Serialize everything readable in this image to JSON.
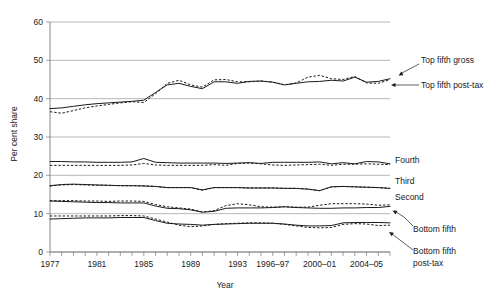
{
  "chart_data": {
    "type": "line",
    "title": "",
    "xlabel": "Year",
    "ylabel": "Per cent share",
    "ylim": [
      0,
      60
    ],
    "yticks": [
      0,
      10,
      20,
      30,
      40,
      50,
      60
    ],
    "grid": true,
    "legend_position": "right-inline-labels",
    "xlim": [
      1977,
      2006
    ],
    "x": [
      1977,
      1978,
      1979,
      1980,
      1981,
      1982,
      1983,
      1984,
      1985,
      1986,
      1987,
      1988,
      1989,
      1990,
      1991,
      1992,
      1993,
      1994,
      1995,
      1996,
      1997,
      1998,
      1999,
      2000,
      2001,
      2002,
      2003,
      2004,
      2005,
      2006
    ],
    "xtick_labels": [
      "1977",
      "1981",
      "1985",
      "1989",
      "1993",
      "1996–97",
      "2000–01",
      "2004–05"
    ],
    "xtick_values": [
      1977,
      1981,
      1985,
      1989,
      1993,
      1996,
      2000,
      2004
    ],
    "series": [
      {
        "name": "Top fifth gross",
        "style": "solid",
        "values": [
          37.4,
          37.6,
          38.0,
          38.4,
          38.7,
          38.9,
          39.1,
          39.3,
          39.6,
          41.6,
          43.6,
          44.0,
          43.2,
          42.6,
          44.4,
          44.4,
          44.0,
          44.5,
          44.6,
          44.3,
          43.6,
          44.0,
          44.4,
          44.5,
          44.8,
          44.6,
          45.6,
          44.3,
          44.5,
          45.2
        ]
      },
      {
        "name": "Top fifth post-tax",
        "style": "dashed",
        "values": [
          36.6,
          36.2,
          36.9,
          37.6,
          38.1,
          38.5,
          38.9,
          39.2,
          39.0,
          41.3,
          44.0,
          44.8,
          43.6,
          43.0,
          44.9,
          45.0,
          44.4,
          44.4,
          44.6,
          44.3,
          43.6,
          44.1,
          45.6,
          46.1,
          45.2,
          45.0,
          45.8,
          44.1,
          44.0,
          45.0
        ]
      },
      {
        "name": "Fourth",
        "style": "solid",
        "values": [
          23.6,
          23.6,
          23.5,
          23.5,
          23.4,
          23.4,
          23.4,
          23.5,
          24.4,
          23.4,
          23.3,
          23.2,
          23.2,
          23.2,
          23.2,
          23.1,
          23.2,
          23.3,
          23.1,
          23.4,
          23.4,
          23.4,
          23.4,
          23.5,
          23.0,
          23.3,
          23.0,
          23.6,
          23.5,
          23.0
        ]
      },
      {
        "name": "Fourth post-tax",
        "style": "dashed",
        "values": [
          22.6,
          22.6,
          22.6,
          22.6,
          22.6,
          22.6,
          22.6,
          22.7,
          23.1,
          22.7,
          22.6,
          22.6,
          22.6,
          22.6,
          22.8,
          22.6,
          23.1,
          23.2,
          23.0,
          22.7,
          22.6,
          22.7,
          22.8,
          22.9,
          22.6,
          22.9,
          22.9,
          23.0,
          22.9,
          22.8
        ]
      },
      {
        "name": "Third",
        "style": "solid",
        "values": [
          17.3,
          17.6,
          17.7,
          17.6,
          17.5,
          17.4,
          17.3,
          17.3,
          17.2,
          17.1,
          16.8,
          16.8,
          16.8,
          16.2,
          16.8,
          16.8,
          16.8,
          16.7,
          16.7,
          16.7,
          16.6,
          16.6,
          16.4,
          16.0,
          17.0,
          17.1,
          17.0,
          16.9,
          16.8,
          16.6
        ]
      },
      {
        "name": "Third post-tax",
        "style": "dashed",
        "values": [
          17.2,
          17.5,
          17.6,
          17.5,
          17.4,
          17.4,
          17.3,
          17.3,
          17.3,
          17.1,
          16.8,
          16.8,
          16.8,
          16.1,
          16.8,
          16.8,
          16.8,
          16.7,
          16.7,
          16.7,
          16.6,
          16.6,
          16.4,
          16.0,
          17.0,
          17.1,
          17.0,
          16.9,
          16.8,
          16.6
        ]
      },
      {
        "name": "Second",
        "style": "solid",
        "values": [
          13.3,
          13.2,
          13.1,
          13.0,
          12.9,
          12.9,
          12.8,
          12.8,
          12.8,
          12.0,
          11.4,
          11.3,
          11.0,
          10.4,
          10.6,
          11.4,
          11.5,
          11.5,
          11.5,
          11.6,
          11.8,
          11.6,
          11.5,
          11.4,
          11.4,
          11.5,
          11.5,
          11.6,
          11.6,
          11.9
        ]
      },
      {
        "name": "Second post-tax",
        "style": "dashed",
        "values": [
          13.4,
          13.4,
          13.4,
          13.3,
          13.3,
          13.2,
          13.3,
          13.3,
          13.2,
          12.4,
          11.8,
          11.5,
          11.2,
          10.4,
          10.8,
          12.1,
          12.6,
          12.3,
          11.8,
          11.7,
          11.8,
          11.7,
          11.7,
          12.2,
          12.6,
          12.6,
          12.6,
          12.5,
          12.2,
          12.3
        ]
      },
      {
        "name": "Bottom fifth",
        "style": "solid",
        "values": [
          8.6,
          8.7,
          8.8,
          8.9,
          8.9,
          8.9,
          9.0,
          9.0,
          9.0,
          8.2,
          7.5,
          7.3,
          7.2,
          7.0,
          7.2,
          7.3,
          7.4,
          7.5,
          7.5,
          7.5,
          7.3,
          7.0,
          6.8,
          6.8,
          6.9,
          7.6,
          7.7,
          7.7,
          7.7,
          7.6
        ]
      },
      {
        "name": "Bottom fifth post-tax",
        "style": "dashed",
        "values": [
          9.4,
          9.4,
          9.4,
          9.4,
          9.4,
          9.4,
          9.5,
          9.5,
          9.4,
          8.6,
          7.8,
          7.0,
          6.6,
          6.8,
          7.2,
          7.4,
          7.5,
          7.6,
          7.6,
          7.5,
          7.2,
          6.8,
          6.4,
          6.3,
          6.4,
          7.2,
          7.4,
          7.3,
          6.9,
          7.0
        ]
      }
    ],
    "annotations": [
      {
        "text": "Top fifth gross",
        "target_series": "Top fifth gross"
      },
      {
        "text": "Top fifth post-tax",
        "target_series": "Top fifth post-tax"
      },
      {
        "text": "Fourth",
        "target_series": "Fourth"
      },
      {
        "text": "Third",
        "target_series": "Third"
      },
      {
        "text": "Second",
        "target_series": "Second"
      },
      {
        "text": "Bottom fifth",
        "target_series": "Bottom fifth"
      },
      {
        "text": "Bottom fifth",
        "target_series": "Bottom fifth post-tax"
      },
      {
        "text": "post-tax",
        "target_series": "Bottom fifth post-tax"
      }
    ],
    "colors": {
      "line": "#1a1a1a",
      "grid": "#9a9a9a",
      "axis": "#7a7a7a",
      "background": "#ffffff"
    }
  },
  "labels": {
    "y_axis_title": "Per cent share",
    "x_axis_title": "Year",
    "yticks": [
      "60",
      "50",
      "40",
      "30",
      "20",
      "10",
      "0"
    ],
    "xticks": [
      "1977",
      "1981",
      "1985",
      "1989",
      "1993",
      "1996–97",
      "2000–01",
      "2004–05"
    ],
    "series_labels": {
      "top_fifth_gross": "Top fifth gross",
      "top_fifth_posttax": "Top fifth post-tax",
      "fourth": "Fourth",
      "third": "Third",
      "second": "Second",
      "bottom_fifth": "Bottom fifth",
      "bottom_fifth_posttax_line1": "Bottom fifth",
      "bottom_fifth_posttax_line2": "post-tax"
    }
  }
}
